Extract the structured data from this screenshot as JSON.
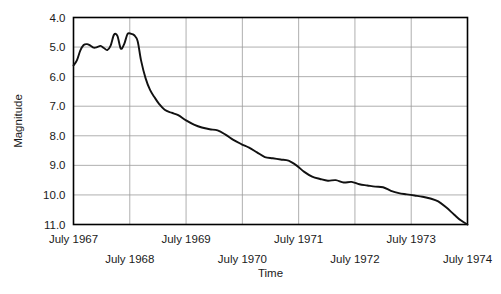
{
  "chart_data": {
    "type": "line",
    "title": "",
    "xlabel": "Time",
    "ylabel": "Magnitude",
    "grid": true,
    "legend": "none",
    "y_inverted": true,
    "ylim": [
      4.0,
      11.0
    ],
    "xlim": [
      1967.5,
      1974.5
    ],
    "yticks": [
      "4.0",
      "5.0",
      "6.0",
      "7.0",
      "8.0",
      "9.0",
      "10.0",
      "11.0"
    ],
    "ytick_values": [
      4.0,
      5.0,
      6.0,
      7.0,
      8.0,
      9.0,
      10.0,
      11.0
    ],
    "xticks": [
      {
        "label": "July 1967",
        "value": 1967.5,
        "row": 0
      },
      {
        "label": "July 1968",
        "value": 1968.5,
        "row": 1
      },
      {
        "label": "July 1969",
        "value": 1969.5,
        "row": 0
      },
      {
        "label": "July 1970",
        "value": 1970.5,
        "row": 1
      },
      {
        "label": "July 1971",
        "value": 1971.5,
        "row": 0
      },
      {
        "label": "July 1972",
        "value": 1972.5,
        "row": 1
      },
      {
        "label": "July 1973",
        "value": 1973.5,
        "row": 0
      },
      {
        "label": "July 1974",
        "value": 1974.5,
        "row": 1
      }
    ],
    "series": [
      {
        "name": "magnitude",
        "color": "#111111",
        "x": [
          1967.5,
          1967.56,
          1967.62,
          1967.68,
          1967.74,
          1967.8,
          1967.86,
          1967.92,
          1967.98,
          1968.04,
          1968.1,
          1968.16,
          1968.22,
          1968.28,
          1968.34,
          1968.4,
          1968.46,
          1968.52,
          1968.58,
          1968.64,
          1968.7,
          1968.78,
          1968.86,
          1968.94,
          1969.02,
          1969.12,
          1969.24,
          1969.36,
          1969.5,
          1969.64,
          1969.78,
          1969.92,
          1970.06,
          1970.2,
          1970.34,
          1970.48,
          1970.62,
          1970.76,
          1970.9,
          1971.04,
          1971.18,
          1971.32,
          1971.46,
          1971.6,
          1971.74,
          1971.88,
          1972.02,
          1972.16,
          1972.3,
          1972.44,
          1972.58,
          1972.72,
          1972.86,
          1973.0,
          1973.14,
          1973.28,
          1973.42,
          1973.56,
          1973.7,
          1973.84,
          1973.98,
          1974.12,
          1974.26,
          1974.38,
          1974.5
        ],
        "y": [
          5.62,
          5.45,
          5.12,
          4.93,
          4.9,
          4.95,
          5.02,
          5.0,
          4.96,
          5.03,
          5.1,
          4.95,
          4.58,
          4.62,
          5.05,
          4.9,
          4.56,
          4.55,
          4.6,
          4.8,
          5.45,
          6.05,
          6.45,
          6.7,
          6.92,
          7.12,
          7.22,
          7.3,
          7.48,
          7.62,
          7.72,
          7.78,
          7.82,
          7.96,
          8.14,
          8.28,
          8.4,
          8.56,
          8.72,
          8.76,
          8.8,
          8.84,
          9.0,
          9.22,
          9.38,
          9.46,
          9.52,
          9.5,
          9.58,
          9.56,
          9.64,
          9.68,
          9.72,
          9.74,
          9.86,
          9.94,
          9.98,
          10.02,
          10.06,
          10.12,
          10.22,
          10.42,
          10.66,
          10.86,
          11.0
        ]
      }
    ]
  },
  "labels": {
    "y_axis_title": "Magnitude",
    "x_axis_title": "Time"
  }
}
